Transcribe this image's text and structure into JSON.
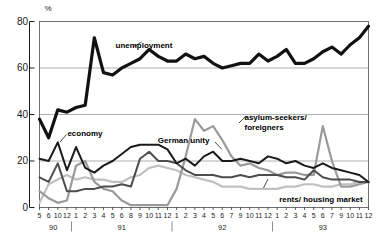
{
  "chart_data": {
    "type": "line",
    "title": "",
    "subtitle": "",
    "xlabel": "",
    "ylabel": "%",
    "ylim": [
      0,
      80
    ],
    "yticks": [
      0,
      20,
      40,
      60,
      80
    ],
    "grid": "horizontal",
    "legend": "inline-annotations",
    "x_tick_labels": [
      "5",
      "6",
      "10",
      "12",
      "1",
      "2",
      "3",
      "4",
      "5",
      "6",
      "8",
      "9",
      "10",
      "11",
      "12",
      "1",
      "2",
      "3",
      "4",
      "5",
      "6",
      "7",
      "9",
      "10",
      "11",
      "12",
      "1",
      "2",
      "3",
      "4",
      "5",
      "6",
      "7",
      "9",
      "10",
      "11",
      "12"
    ],
    "year_groups": [
      {
        "label": "90",
        "start_index": 0,
        "end_index": 3
      },
      {
        "label": "91",
        "start_index": 4,
        "end_index": 14
      },
      {
        "label": "92",
        "start_index": 15,
        "end_index": 25
      },
      {
        "label": "93",
        "start_index": 26,
        "end_index": 36
      }
    ],
    "series": [
      {
        "name": "unemployment",
        "color": "#111111",
        "width": 3.2,
        "values": [
          38,
          30,
          42,
          41,
          43,
          44,
          73,
          58,
          57,
          60,
          62,
          64,
          68,
          65,
          63,
          63,
          66,
          64,
          65,
          62,
          60,
          61,
          62,
          62,
          66,
          63,
          65,
          68,
          62,
          62,
          64,
          67,
          69,
          66,
          70,
          73,
          78
        ]
      },
      {
        "name": "economy",
        "color": "#1a1a1a",
        "width": 2.0,
        "values": [
          21,
          20,
          28,
          16,
          26,
          17,
          15,
          18,
          20,
          23,
          26,
          27,
          27,
          27,
          25,
          19,
          21,
          18,
          22,
          24,
          20,
          20,
          21,
          20,
          19,
          22,
          21,
          19,
          20,
          18,
          17,
          19,
          17,
          16,
          15,
          14,
          11
        ]
      },
      {
        "name": "German unity",
        "color": "#4d4d4d",
        "width": 2.0,
        "values": [
          13,
          11,
          19,
          7,
          7,
          8,
          8,
          9,
          9,
          10,
          9,
          21,
          24,
          20,
          20,
          19,
          16,
          14,
          14,
          14,
          13,
          13,
          14,
          13,
          14,
          14,
          14,
          13,
          13,
          12,
          16,
          13,
          12,
          12,
          12,
          11,
          11
        ]
      },
      {
        "name": "asylum-seekers/ foreigners",
        "color": "#9a9a9a",
        "width": 2.2,
        "values": [
          7,
          4,
          2,
          3,
          18,
          20,
          11,
          8,
          7,
          3,
          1,
          1,
          1,
          1,
          1,
          8,
          22,
          38,
          33,
          35,
          29,
          22,
          18,
          19,
          17,
          16,
          14,
          15,
          15,
          14,
          14,
          35,
          20,
          9,
          9,
          10,
          11
        ]
      },
      {
        "name": "rents/ housing market",
        "color": "#c0c0c0",
        "width": 2.2,
        "values": [
          2,
          10,
          12,
          14,
          12,
          13,
          12,
          12,
          11,
          11,
          13,
          14,
          17,
          18,
          17,
          16,
          14,
          13,
          12,
          11,
          9,
          9,
          9,
          8,
          8,
          8,
          8,
          9,
          9,
          10,
          10,
          9,
          9,
          10,
          10,
          11,
          11
        ]
      }
    ],
    "annotations": [
      {
        "text": "unemployment",
        "x_pct": 30.0,
        "y_pct": 16.5
      },
      {
        "text": "economy",
        "x_pct": 17.5,
        "y_pct": 52.0
      },
      {
        "text": "German unity",
        "x_pct": 41.0,
        "y_pct": 54.5
      },
      {
        "text": "asylum-seekers/ foreigners",
        "x_pct": 63.5,
        "y_pct": 45.5
      },
      {
        "text": "rents/ housing market",
        "x_pct": 72.5,
        "y_pct": 78.5
      }
    ]
  }
}
